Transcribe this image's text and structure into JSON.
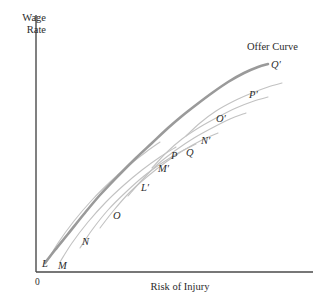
{
  "chart_data": {
    "type": "line",
    "title": "",
    "xlabel": "Risk of Injury",
    "ylabel": "Wage Rate",
    "origin_label": "0",
    "grid": false,
    "legend_position": "none",
    "annotations": [
      {
        "name": "offer-curve-annotation",
        "text": "Offer Curve",
        "x": 247,
        "y": 41
      }
    ],
    "axes": {
      "x_start": 36,
      "x_end": 313,
      "y_top": 15,
      "y_bottom": 272,
      "color": "#4a4a4a"
    },
    "series": [
      {
        "name": "Offer Curve",
        "role": "offer-curve",
        "color": "#9a9a9a",
        "width": 2.6,
        "points": [
          [
            45,
            263
          ],
          [
            55,
            250
          ],
          [
            68,
            234
          ],
          [
            84,
            214
          ],
          [
            100,
            195
          ],
          [
            118,
            176
          ],
          [
            136,
            158
          ],
          [
            152,
            143
          ],
          [
            168,
            128
          ],
          [
            182,
            116
          ],
          [
            196,
            105
          ],
          [
            212,
            93
          ],
          [
            228,
            82
          ],
          [
            244,
            73
          ],
          [
            258,
            67
          ],
          [
            268,
            64
          ]
        ]
      },
      {
        "name": "L",
        "role": "indifference-curve",
        "color": "#c2c2c2",
        "width": 1.1,
        "points": [
          [
            46,
            263
          ],
          [
            58,
            243
          ],
          [
            74,
            221
          ],
          [
            92,
            200
          ],
          [
            110,
            182
          ],
          [
            128,
            166
          ],
          [
            146,
            152
          ],
          [
            160,
            142
          ]
        ]
      },
      {
        "name": "M",
        "role": "indifference-curve",
        "color": "#c2c2c2",
        "width": 1.1,
        "points": [
          [
            60,
            262
          ],
          [
            72,
            243
          ],
          [
            88,
            222
          ],
          [
            106,
            202
          ],
          [
            124,
            185
          ],
          [
            142,
            170
          ],
          [
            160,
            157
          ],
          [
            176,
            147
          ]
        ]
      },
      {
        "name": "N",
        "role": "indifference-curve",
        "color": "#c2c2c2",
        "width": 1.1,
        "points": [
          [
            80,
            248
          ],
          [
            92,
            230
          ],
          [
            108,
            210
          ],
          [
            126,
            192
          ],
          [
            144,
            176
          ],
          [
            162,
            163
          ],
          [
            180,
            152
          ],
          [
            196,
            144
          ]
        ]
      },
      {
        "name": "O",
        "role": "indifference-curve",
        "color": "#c2c2c2",
        "width": 1.1,
        "points": [
          [
            100,
            228
          ],
          [
            114,
            210
          ],
          [
            130,
            192
          ],
          [
            148,
            176
          ],
          [
            166,
            162
          ],
          [
            184,
            150
          ],
          [
            202,
            140
          ],
          [
            218,
            133
          ]
        ]
      },
      {
        "name": "P",
        "role": "indifference-curve",
        "color": "#c2c2c2",
        "width": 1.1,
        "points": [
          [
            128,
            196
          ],
          [
            142,
            180
          ],
          [
            158,
            164
          ],
          [
            176,
            150
          ],
          [
            194,
            138
          ],
          [
            212,
            128
          ],
          [
            230,
            119
          ],
          [
            246,
            113
          ]
        ]
      },
      {
        "name": "Q",
        "role": "indifference-curve",
        "color": "#c2c2c2",
        "width": 1.1,
        "points": [
          [
            152,
            168
          ],
          [
            166,
            153
          ],
          [
            182,
            139
          ],
          [
            200,
            127
          ],
          [
            218,
            117
          ],
          [
            236,
            108
          ],
          [
            254,
            101
          ],
          [
            268,
            97
          ]
        ]
      },
      {
        "name": "R",
        "role": "indifference-curve",
        "color": "#c2c2c2",
        "width": 1.1,
        "points": [
          [
            186,
            136
          ],
          [
            200,
            123
          ],
          [
            216,
            111
          ],
          [
            234,
            101
          ],
          [
            252,
            93
          ],
          [
            268,
            87
          ],
          [
            282,
            83
          ]
        ]
      }
    ],
    "point_labels": [
      {
        "name": "label-L",
        "text": "L",
        "x": 42,
        "y": 258
      },
      {
        "name": "label-M",
        "text": "M",
        "x": 58,
        "y": 260
      },
      {
        "name": "label-N",
        "text": "N",
        "x": 82,
        "y": 236
      },
      {
        "name": "label-O",
        "text": "O",
        "x": 113,
        "y": 210
      },
      {
        "name": "label-L-prime",
        "text": "L′",
        "x": 141,
        "y": 182
      },
      {
        "name": "label-M-prime",
        "text": "M′",
        "x": 158,
        "y": 163
      },
      {
        "name": "label-P",
        "text": "P",
        "x": 171,
        "y": 150
      },
      {
        "name": "label-Q",
        "text": "Q",
        "x": 186,
        "y": 147
      },
      {
        "name": "label-N-prime",
        "text": "N′",
        "x": 201,
        "y": 135
      },
      {
        "name": "label-O-prime",
        "text": "O′",
        "x": 216,
        "y": 113
      },
      {
        "name": "label-P-prime",
        "text": "P′",
        "x": 249,
        "y": 89
      },
      {
        "name": "label-Q-prime",
        "text": "Q′",
        "x": 271,
        "y": 59
      }
    ]
  }
}
